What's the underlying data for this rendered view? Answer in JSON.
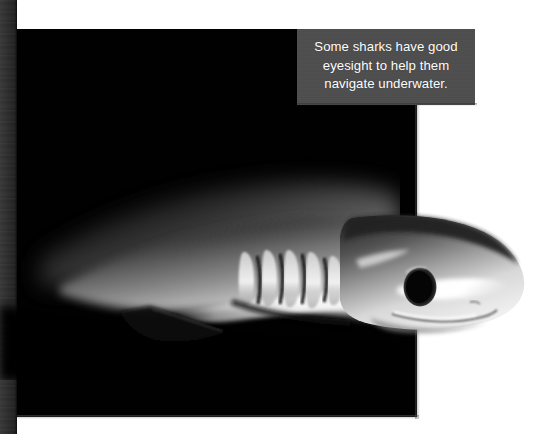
{
  "page": {
    "background_color": "#ffffff",
    "kind": "book-page-photograph"
  },
  "gutter": {
    "name": "page-binding-strip",
    "color": "#2d2d2d"
  },
  "photo": {
    "name": "shark-photograph",
    "background_color": "#010101",
    "subject": "shark",
    "subject_features": [
      "gill-slits",
      "eye",
      "snout",
      "pectoral-fin",
      "dorsal-body-highlight",
      "jaw-line"
    ],
    "frame": {
      "left": 17,
      "top": 29,
      "width": 400,
      "height": 388
    }
  },
  "caption": {
    "name": "photo-caption",
    "text": "Some sharks have good eyesight to help them navigate underwater.",
    "background_color": "#4e4e4e",
    "text_color": "#ffffff",
    "align": "center",
    "position": "top-right-overlay"
  },
  "colors": {
    "paper": "#ffffff",
    "photo_black": "#010101",
    "caption_gray": "#4e4e4e",
    "binding_gray": "#2d2d2d",
    "shark_highlight": "#f2f2f2",
    "shark_midtone": "#8a8a8a",
    "eye_black": "#050505"
  }
}
